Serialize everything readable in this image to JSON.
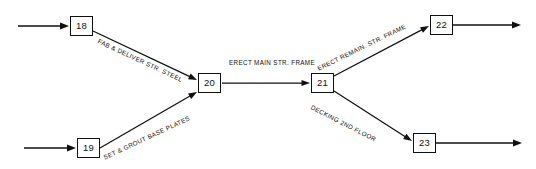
{
  "diagram": {
    "type": "activity-on-arrow-network",
    "nodes": [
      {
        "id": "18",
        "label": "18",
        "x": 70,
        "y": 16,
        "w": 23,
        "h": 20
      },
      {
        "id": "19",
        "label": "19",
        "x": 77,
        "y": 138,
        "w": 23,
        "h": 20
      },
      {
        "id": "20",
        "label": "20",
        "x": 198,
        "y": 73,
        "w": 23,
        "h": 20
      },
      {
        "id": "21",
        "label": "21",
        "x": 311,
        "y": 73,
        "w": 23,
        "h": 20
      },
      {
        "id": "22",
        "label": "22",
        "x": 430,
        "y": 15,
        "w": 23,
        "h": 20
      },
      {
        "id": "23",
        "label": "23",
        "x": 413,
        "y": 133,
        "w": 23,
        "h": 20
      }
    ],
    "edges": [
      {
        "id": "edge-18-20",
        "from": "18",
        "to": "20",
        "label": "FAB & DELIVER STR. STEEL",
        "label_x": 98,
        "label_y": 38,
        "label_rotation": 25,
        "x1": 93,
        "y1": 31,
        "x2": 197,
        "y2": 80
      },
      {
        "id": "edge-19-20",
        "from": "19",
        "to": "20",
        "label": "SET & GROUT BASE PLATES",
        "label_x": 104,
        "label_y": 155,
        "label_rotation": -25,
        "x1": 100,
        "y1": 148,
        "x2": 197,
        "y2": 92
      },
      {
        "id": "edge-20-21",
        "from": "20",
        "to": "21",
        "label": "ERECT MAIN STR. FRAME",
        "label_x": 272,
        "label_y": 63,
        "label_rotation": 0,
        "x1": 222,
        "y1": 83,
        "x2": 310,
        "y2": 83
      },
      {
        "id": "edge-21-22",
        "from": "21",
        "to": "22",
        "label": "ERECT REMAIN. STR. FRAME",
        "label_x": 318,
        "label_y": 66,
        "label_rotation": -26,
        "x1": 334,
        "y1": 76,
        "x2": 429,
        "y2": 26
      },
      {
        "id": "edge-21-23",
        "from": "21",
        "to": "23",
        "label": "DECKING 2ND FLOOR",
        "label_x": 311,
        "label_y": 104,
        "label_rotation": 27,
        "x1": 334,
        "y1": 91,
        "x2": 412,
        "y2": 141
      }
    ],
    "entries": [
      {
        "id": "entry-18",
        "to": "18",
        "x1": 18,
        "y1": 26,
        "x2": 69,
        "y2": 26
      },
      {
        "id": "entry-19",
        "to": "19",
        "x1": 24,
        "y1": 148,
        "x2": 76,
        "y2": 148
      }
    ],
    "exits": [
      {
        "id": "exit-22",
        "from": "22",
        "x1": 453,
        "y1": 25,
        "x2": 521,
        "y2": 25
      },
      {
        "id": "exit-23",
        "from": "23",
        "x1": 436,
        "y1": 143,
        "x2": 522,
        "y2": 143
      }
    ]
  },
  "colors": {
    "line": "#101010",
    "node_border": "#101010",
    "background": "#ffffff",
    "text": "#101010"
  }
}
